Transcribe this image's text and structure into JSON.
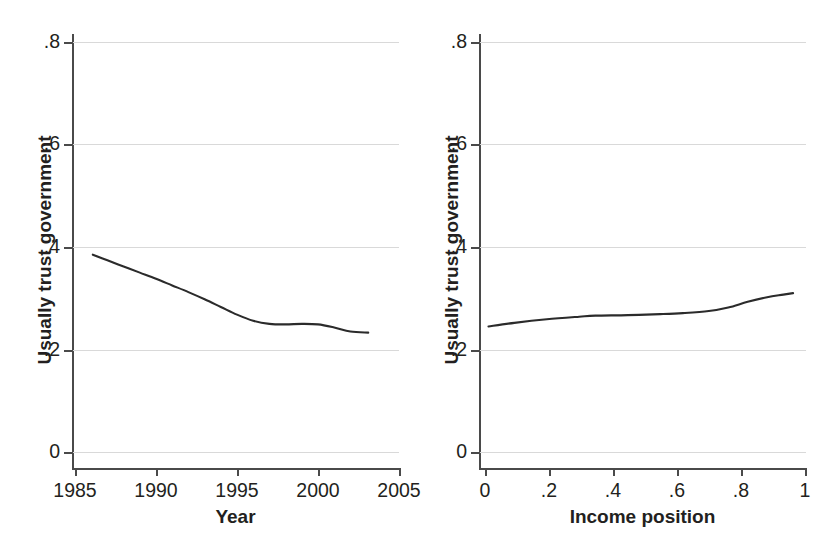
{
  "figure": {
    "background": "#ffffff",
    "line_color": "#2b2b2b",
    "grid_color": "#d9d9d9",
    "axis_color": "#4a4a4a"
  },
  "panels": [
    {
      "id": "left",
      "y_axis_title": "Usually trust government",
      "x_axis_title": "Year",
      "y_ticks": [
        ".8",
        ".6",
        ".4",
        ".2",
        "0"
      ],
      "x_ticks": [
        "1985",
        "1990",
        "1995",
        "2000",
        "2005"
      ]
    },
    {
      "id": "right",
      "y_axis_title": "Usually trust government",
      "x_axis_title": "Income position",
      "y_ticks": [
        ".8",
        ".6",
        ".4",
        ".2",
        "0"
      ],
      "x_ticks": [
        "0",
        ".2",
        ".4",
        ".6",
        ".8",
        "1"
      ]
    }
  ],
  "chart_data": [
    {
      "type": "line",
      "title": "",
      "subtitle": "",
      "xlabel": "Year",
      "ylabel": "Usually trust government",
      "xlim": [
        1985,
        2005
      ],
      "ylim": [
        0,
        0.8
      ],
      "xticks": [
        1985,
        1990,
        1995,
        2000,
        2005
      ],
      "yticks": [
        0,
        0.2,
        0.4,
        0.6,
        0.8
      ],
      "grid": "horizontal",
      "legend": "none",
      "series": [
        {
          "name": "Usually trust government (by year)",
          "x": [
            1986.1,
            1987,
            1988,
            1989,
            1990,
            1991,
            1992,
            1993,
            1994,
            1995,
            1996,
            1997,
            1998,
            1999,
            2000,
            2001,
            2002,
            2003.1
          ],
          "values": [
            0.385,
            0.374,
            0.362,
            0.35,
            0.338,
            0.325,
            0.312,
            0.298,
            0.283,
            0.268,
            0.256,
            0.25,
            0.249,
            0.25,
            0.249,
            0.243,
            0.235,
            0.233
          ]
        }
      ]
    },
    {
      "type": "line",
      "title": "",
      "subtitle": "",
      "xlabel": "Income position",
      "ylabel": "Usually trust government",
      "xlim": [
        0,
        1
      ],
      "ylim": [
        0,
        0.8
      ],
      "xticks": [
        0,
        0.2,
        0.4,
        0.6,
        0.8,
        1
      ],
      "yticks": [
        0,
        0.2,
        0.4,
        0.6,
        0.8
      ],
      "grid": "horizontal",
      "legend": "none",
      "series": [
        {
          "name": "Usually trust government (by income position)",
          "x": [
            0.02,
            0.1,
            0.2,
            0.3,
            0.35,
            0.45,
            0.55,
            0.62,
            0.7,
            0.76,
            0.82,
            0.88,
            0.93,
            0.96
          ],
          "values": [
            0.245,
            0.252,
            0.259,
            0.264,
            0.266,
            0.267,
            0.269,
            0.271,
            0.275,
            0.282,
            0.293,
            0.302,
            0.307,
            0.31
          ]
        }
      ]
    }
  ]
}
